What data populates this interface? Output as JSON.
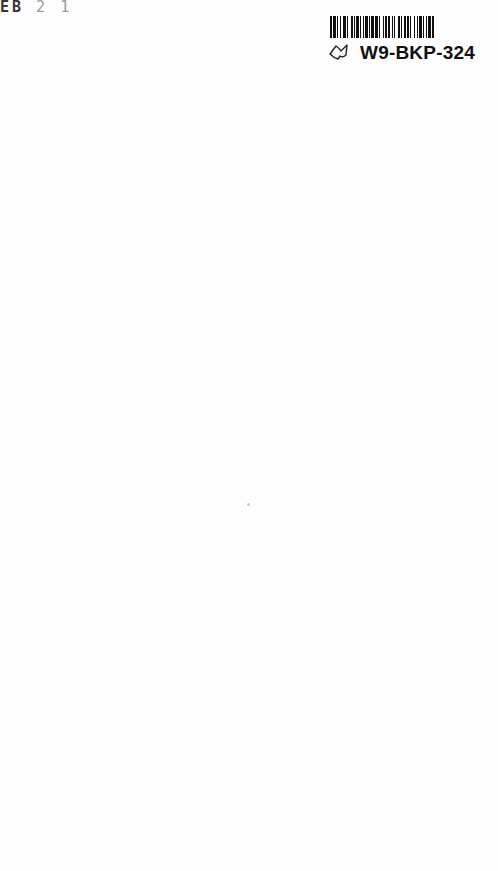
{
  "page": {
    "background": "#fdfdfd",
    "stamp_fragment": {
      "first": "EB",
      "rest": " 2 1"
    },
    "barcode": {
      "label": "W9-BKP-324",
      "icon": "book-outline-icon",
      "bars": [
        2,
        1,
        2,
        1,
        1,
        2,
        1,
        1,
        3,
        1,
        1,
        2,
        2,
        1,
        1,
        1,
        2,
        1,
        1,
        2,
        1,
        1,
        2,
        1,
        1,
        1,
        2,
        1,
        3,
        1,
        1,
        2,
        1,
        1,
        2,
        1,
        1,
        2,
        1,
        1,
        1,
        2,
        2,
        1,
        1,
        2,
        1,
        1,
        2,
        1,
        1,
        2,
        1,
        2,
        1,
        1,
        2,
        1,
        1,
        2,
        1,
        1,
        2,
        1,
        2
      ]
    }
  }
}
